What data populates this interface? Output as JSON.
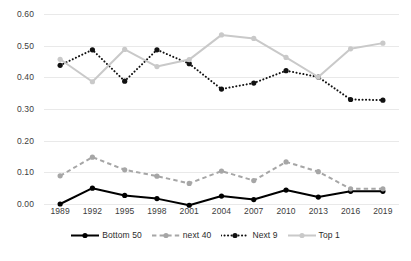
{
  "chart_data": {
    "type": "line",
    "title": "",
    "subtitle": "",
    "xlabel": "",
    "ylabel": "",
    "categories": [
      "1989",
      "1992",
      "1995",
      "1998",
      "2001",
      "2004",
      "2007",
      "2010",
      "2013",
      "2016",
      "2019"
    ],
    "ylim": [
      0.0,
      0.6
    ],
    "yticks": [
      "0.00",
      "0.10",
      "0.20",
      "0.30",
      "0.40",
      "0.50",
      "0.60"
    ],
    "ytick_values": [
      0.0,
      0.1,
      0.2,
      0.3,
      0.4,
      0.5,
      0.6
    ],
    "grid": true,
    "legend_position": "bottom",
    "series": [
      {
        "name": "Bottom 50",
        "color": "#000000",
        "style": "solid",
        "marker": "circle",
        "values": [
          0.0,
          0.05,
          0.027,
          0.017,
          -0.004,
          0.025,
          0.014,
          0.044,
          0.022,
          0.04,
          0.04
        ]
      },
      {
        "name": "next 40",
        "color": "#a6a6a6",
        "style": "dashed",
        "marker": "circle",
        "values": [
          0.089,
          0.148,
          0.108,
          0.088,
          0.065,
          0.104,
          0.074,
          0.133,
          0.102,
          0.048,
          0.048
        ]
      },
      {
        "name": "Next 9",
        "color": "#111111",
        "style": "dotted",
        "marker": "circle",
        "values": [
          0.438,
          0.487,
          0.388,
          0.487,
          0.443,
          0.363,
          0.382,
          0.421,
          0.401,
          0.33,
          0.328
        ]
      },
      {
        "name": "Top 1",
        "color": "#c9c9c9",
        "style": "solid",
        "marker": "circle",
        "values": [
          0.457,
          0.386,
          0.488,
          0.434,
          0.456,
          0.534,
          0.523,
          0.463,
          0.401,
          0.49,
          0.508
        ]
      }
    ]
  },
  "legend": {
    "items": [
      {
        "label": "Bottom 50"
      },
      {
        "label": "next 40"
      },
      {
        "label": "Next 9"
      },
      {
        "label": "Top 1"
      }
    ]
  }
}
